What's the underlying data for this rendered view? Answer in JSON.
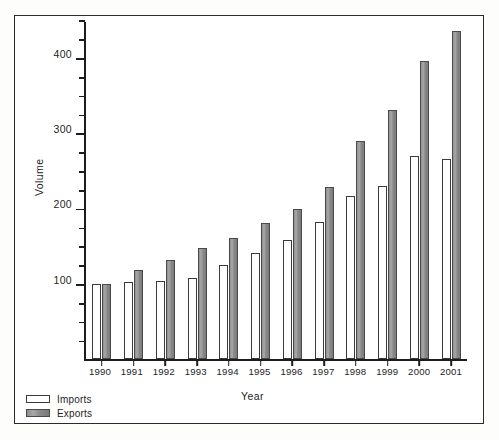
{
  "figure": {
    "background_color": "#ffffff",
    "frame_color": "#2b2b2b",
    "imports_color": "#ffffff",
    "exports_color": "#8e8e8e"
  },
  "axis": {
    "y_title": "Volume",
    "x_title": "Year",
    "y_major_labels": [
      "100",
      "200",
      "300",
      "400"
    ],
    "y_major_values": [
      100,
      200,
      300,
      400
    ],
    "y_minor_values": [
      25,
      50,
      75,
      125,
      150,
      175,
      225,
      250,
      275,
      325,
      350,
      375,
      425,
      450
    ]
  },
  "legend": {
    "position": "bottom-left",
    "entries": [
      {
        "label": "Imports",
        "swatch": "imports"
      },
      {
        "label": "Exports",
        "swatch": "exports"
      }
    ]
  },
  "chart_data": {
    "type": "bar",
    "title": "",
    "xlabel": "Year",
    "ylabel": "Volume",
    "ylim": [
      0,
      450
    ],
    "grid": false,
    "legend_position": "bottom-left",
    "categories": [
      "1990",
      "1991",
      "1992",
      "1993",
      "1994",
      "1995",
      "1996",
      "1997",
      "1998",
      "1999",
      "2000",
      "2001"
    ],
    "series": [
      {
        "name": "Imports",
        "values": [
          100,
          102,
          104,
          108,
          125,
          141,
          158,
          182,
          216,
          230,
          270,
          266
        ]
      },
      {
        "name": "Exports",
        "values": [
          100,
          118,
          131,
          148,
          160,
          180,
          199,
          228,
          290,
          331,
          396,
          436
        ]
      }
    ]
  }
}
